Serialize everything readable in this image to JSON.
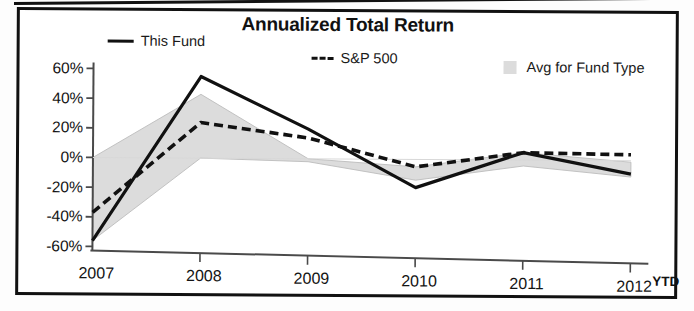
{
  "chart_data": {
    "type": "line",
    "title": "Annualized Total Return",
    "xlabel": "",
    "ylabel": "",
    "grid": false,
    "legend_position": "top",
    "x": [
      "2007",
      "2008",
      "2009",
      "2010",
      "2011",
      "2012"
    ],
    "x_note": "YTD",
    "categories": [
      "2007",
      "2008",
      "2009",
      "2010",
      "2011",
      "2012"
    ],
    "ylim": [
      -60,
      60
    ],
    "ytick_labels": [
      "60%",
      "40%",
      "20%",
      "0%",
      "-20%",
      "-40%",
      "-60%"
    ],
    "ytick_values": [
      60,
      40,
      20,
      0,
      -20,
      -40,
      -60
    ],
    "series": [
      {
        "name": "This Fund",
        "style": "solid",
        "color": "#111111",
        "values": [
          -56,
          55,
          20,
          -19,
          5,
          -9
        ]
      },
      {
        "name": "S&P 500",
        "style": "dashed",
        "color": "#111111",
        "values": [
          -37,
          24,
          14,
          -5,
          5,
          4
        ]
      },
      {
        "name": "Avg for Fund Type",
        "style": "area",
        "color": "#dcdcdc",
        "upper": [
          0,
          43,
          0,
          -5,
          5,
          -1
        ],
        "lower": [
          -56,
          0,
          -2,
          -14,
          -4,
          -11
        ]
      }
    ],
    "annotations": []
  },
  "chart": {
    "title": "Annualized Total Return"
  },
  "legend": {
    "items": [
      {
        "label": "This Fund",
        "marker": "solid-line-swatch"
      },
      {
        "label": "S&P 500",
        "marker": "dashed-line-swatch",
        "prefix": "---"
      },
      {
        "label": "Avg for Fund Type",
        "marker": "gray-area-swatch"
      }
    ],
    "this_fund": "This Fund",
    "sp500": "S&P 500",
    "sp500_prefix": "---",
    "avg_for_fund_type": "Avg for Fund Type"
  },
  "axes": {
    "y_labels": [
      "60%",
      "40%",
      "20%",
      "0%",
      "-20%",
      "-40%",
      "-60%"
    ],
    "x_labels": [
      "2007",
      "2008",
      "2009",
      "2010",
      "2011",
      "2012"
    ],
    "ytd": "YTD"
  },
  "colors": {
    "line": "#111111",
    "area": "#dcdcdc",
    "axis": "#4a4a4a",
    "text": "#141414",
    "frame": "#111111",
    "background": "#ffffff"
  }
}
